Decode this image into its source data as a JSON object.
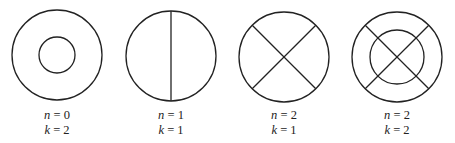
{
  "figures": [
    {
      "id": "fig-1",
      "n_label": "n = 0",
      "k_label": "k = 2",
      "n": 0,
      "k": 2,
      "description": "outer circle with concentric inner circle"
    },
    {
      "id": "fig-2",
      "n_label": "n = 1",
      "k_label": "k = 1",
      "n": 1,
      "k": 1,
      "description": "circle split by one vertical diameter"
    },
    {
      "id": "fig-3",
      "n_label": "n = 2",
      "k_label": "k = 1",
      "n": 2,
      "k": 1,
      "description": "circle with two crossing diagonal diameters"
    },
    {
      "id": "fig-4",
      "n_label": "n = 2",
      "k_label": "k = 2",
      "n": 2,
      "k": 2,
      "description": "two concentric circles with two crossing diagonal diameters"
    }
  ],
  "colors": {
    "stroke": "#222222",
    "background": "#ffffff"
  }
}
